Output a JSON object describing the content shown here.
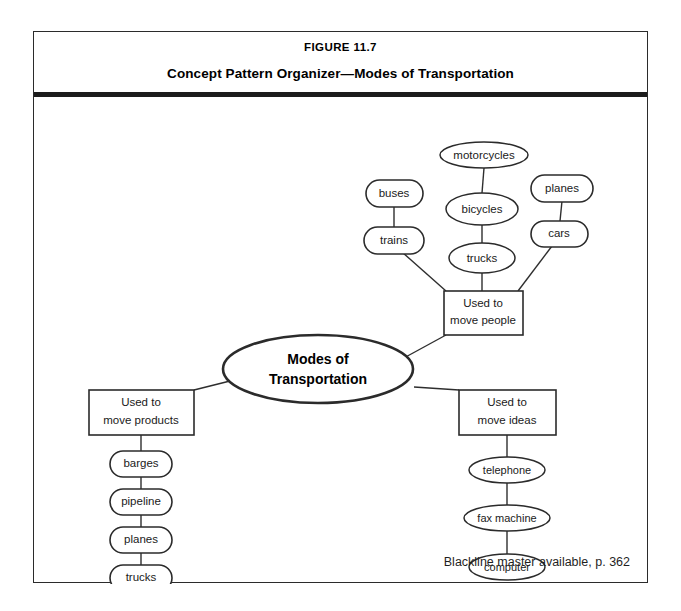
{
  "figure": {
    "number": "FIGURE 11.7",
    "title": "Concept Pattern Organizer—Modes of Transportation",
    "footer_note": "Blackline master available, p. 362"
  },
  "diagram": {
    "type": "concept-pattern-organizer",
    "center": {
      "label_line1": "Modes of",
      "label_line2": "Transportation"
    },
    "branches": [
      {
        "id": "people",
        "label_line1": "Used to",
        "label_line2": "move people",
        "items": [
          "buses",
          "trains",
          "motorcycles",
          "bicycles",
          "trucks",
          "planes",
          "cars"
        ],
        "chains": [
          [
            "buses",
            "trains"
          ],
          [
            "motorcycles",
            "bicycles",
            "trucks"
          ],
          [
            "planes",
            "cars"
          ]
        ]
      },
      {
        "id": "products",
        "label_line1": "Used to",
        "label_line2": "move products",
        "items": [
          "barges",
          "pipeline",
          "planes",
          "trucks",
          "trains"
        ],
        "chains": [
          [
            "barges",
            "pipeline",
            "planes",
            "trucks",
            "trains"
          ]
        ]
      },
      {
        "id": "ideas",
        "label_line1": "Used to",
        "label_line2": "move ideas",
        "items": [
          "telephone",
          "fax machine",
          "computer"
        ],
        "chains": [
          [
            "telephone",
            "fax machine",
            "computer"
          ]
        ]
      }
    ],
    "nodes": {
      "motorcycles": "motorcycles",
      "bicycles": "bicycles",
      "trucks_top": "trucks",
      "buses": "buses",
      "trains_top": "trains",
      "planes_top": "planes",
      "cars": "cars",
      "barges": "barges",
      "pipeline": "pipeline",
      "planes_left": "planes",
      "trucks_left": "trucks",
      "trains_left": "trains",
      "telephone": "telephone",
      "fax_machine": "fax machine",
      "computer": "computer"
    },
    "colors": {
      "stroke": "#2b2b2b",
      "text": "#1a1a1a",
      "background": "#ffffff",
      "rule": "#1c1c1c"
    }
  }
}
